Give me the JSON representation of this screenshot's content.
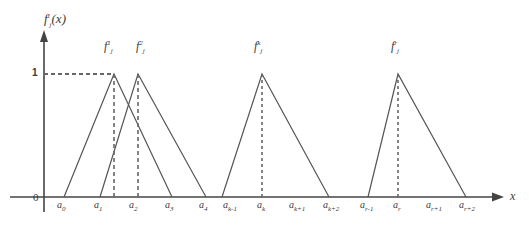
{
  "figure": {
    "y_axis_title": "f",
    "y_axis_title_sub": "j",
    "y_axis_title_sup": "i",
    "y_axis_title_arg": "(x)",
    "x_axis_label": "x",
    "origin_label": "0",
    "unit_label": "1",
    "colors": {
      "line": "#555555",
      "axis": "#444444",
      "dashed": "#666666",
      "background": "#ffffff"
    }
  },
  "chart_data": {
    "type": "line",
    "title": "",
    "subtitle": "",
    "xlabel": "x",
    "ylabel": "f_j^i(x)",
    "ylim": [
      0,
      1.15
    ],
    "grid": false,
    "legend": "none",
    "y_ticks": [
      {
        "value": 1,
        "label": "1"
      }
    ],
    "x_ticks": [
      {
        "label": "a",
        "sub": "0",
        "px": 62
      },
      {
        "label": "a",
        "sub": "1",
        "px": 99
      },
      {
        "label": "a",
        "sub": "2",
        "px": 134
      },
      {
        "label": "a",
        "sub": "3",
        "px": 170
      },
      {
        "label": "a",
        "sub": "4",
        "px": 204
      },
      {
        "label": "a",
        "sub": "k-1",
        "px": 228
      },
      {
        "label": "a",
        "sub": "k",
        "px": 262
      },
      {
        "label": "a",
        "sub": "k+1",
        "px": 294
      },
      {
        "label": "a",
        "sub": "k+2",
        "px": 328
      },
      {
        "label": "a",
        "sub": "r-1",
        "px": 365
      },
      {
        "label": "a",
        "sub": "r",
        "px": 398
      },
      {
        "label": "a",
        "sub": "r+1",
        "px": 431
      },
      {
        "label": "a",
        "sub": "r+2",
        "px": 464
      }
    ],
    "series": [
      {
        "name": "f_j^1",
        "label_base": "f",
        "label_sub": "j",
        "label_sup": "1",
        "label_px": {
          "x": 104,
          "y": 44
        },
        "peak_px": 114,
        "points_px": [
          [
            64,
            197
          ],
          [
            114,
            74
          ],
          [
            172,
            197
          ]
        ]
      },
      {
        "name": "f_j^2",
        "label_base": "f",
        "label_sub": "j",
        "label_sup": "2",
        "label_px": {
          "x": 139,
          "y": 44
        },
        "peak_px": 138,
        "points_px": [
          [
            100,
            197
          ],
          [
            138,
            74
          ],
          [
            206,
            197
          ]
        ]
      },
      {
        "name": "f_j^k",
        "label_base": "f",
        "label_sub": "j",
        "label_sup": "k",
        "label_px": {
          "x": 253,
          "y": 44
        },
        "peak_px": 262,
        "points_px": [
          [
            222,
            197
          ],
          [
            262,
            74
          ],
          [
            329,
            197
          ]
        ]
      },
      {
        "name": "f_j^r",
        "label_base": "f",
        "label_sub": "j",
        "label_sup": "r",
        "label_px": {
          "x": 398,
          "y": 44
        },
        "peak_px": 398,
        "points_px": [
          [
            368,
            197
          ],
          [
            398,
            74
          ],
          [
            466,
            197
          ]
        ]
      }
    ],
    "dashed_guides": {
      "horizontal_y_px": 74,
      "horizontal_from_px": 44,
      "horizontal_to_px": 114,
      "vertical_peaks_px": [
        114,
        138,
        262,
        398
      ]
    }
  }
}
